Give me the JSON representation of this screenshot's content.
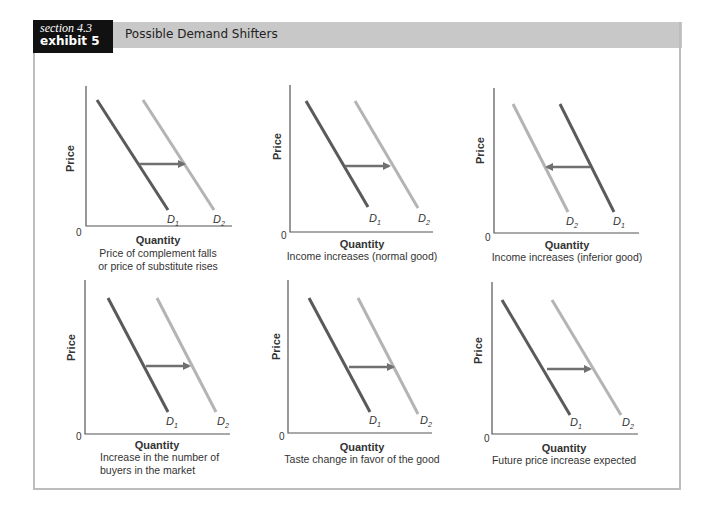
{
  "header": {
    "section": "section 4.3",
    "exhibit": "exhibit 5",
    "title": "Possible Demand Shifters"
  },
  "colors": {
    "d1_line": "#5a5a5a",
    "d2_line": "#b4b4b4",
    "arrow": "#707070",
    "axis": "#555555",
    "band": "#c8c8c8",
    "label_box": "#111111"
  },
  "panels": [
    {
      "ylabel": "Price",
      "xlabel": "Quantity",
      "origin": "0",
      "caption_1": "Price of complement falls",
      "caption_2": "or price of substitute rises",
      "curve_a": "D1",
      "curve_b": "D2",
      "shift": "right"
    },
    {
      "ylabel": "Price",
      "xlabel": "Quantity",
      "origin": "0",
      "caption_1": "Income increases (normal good)",
      "caption_2": "",
      "curve_a": "D1",
      "curve_b": "D2",
      "shift": "right"
    },
    {
      "ylabel": "Price",
      "xlabel": "Quantity",
      "origin": "0",
      "caption_1": "Income increases (inferior good)",
      "caption_2": "",
      "curve_a": "D1",
      "curve_b": "D2",
      "shift": "left"
    },
    {
      "ylabel": "Price",
      "xlabel": "Quantity",
      "origin": "0",
      "caption_1": "Increase in the number of",
      "caption_2": "buyers in the market",
      "curve_a": "D1",
      "curve_b": "D2",
      "shift": "right"
    },
    {
      "ylabel": "Price",
      "xlabel": "Quantity",
      "origin": "0",
      "caption_1": "Taste change in favor of the good",
      "caption_2": "",
      "curve_a": "D1",
      "curve_b": "D2",
      "shift": "right"
    },
    {
      "ylabel": "Price",
      "xlabel": "Quantity",
      "origin": "0",
      "caption_1": "Future price increase expected",
      "caption_2": "",
      "curve_a": "D1",
      "curve_b": "D2",
      "shift": "right"
    }
  ],
  "subscripts": {
    "one": "1",
    "two": "2",
    "D": "D"
  }
}
